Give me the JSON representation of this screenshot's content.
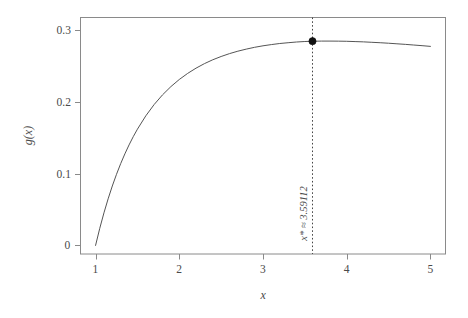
{
  "chart_data": {
    "type": "line",
    "title": "",
    "xlabel": "x",
    "ylabel": "g(x)",
    "xlim": [
      0.82,
      5.18
    ],
    "ylim": [
      -0.012,
      0.318
    ],
    "xticks": [
      "1",
      "2",
      "3",
      "4",
      "5"
    ],
    "xtick_values": [
      1,
      2,
      3,
      4,
      5
    ],
    "yticks": [
      "0",
      "0.1",
      "0.2",
      "0.3"
    ],
    "ytick_values": [
      0,
      0.1,
      0.2,
      0.3
    ],
    "grid": false,
    "legend": null,
    "frame": true,
    "series": [
      {
        "name": "g(x)",
        "x": [
          1.0,
          1.05,
          1.1,
          1.15,
          1.2,
          1.25,
          1.3,
          1.35,
          1.4,
          1.45,
          1.5,
          1.6,
          1.7,
          1.8,
          1.9,
          2.0,
          2.1,
          2.2,
          2.3,
          2.4,
          2.5,
          2.6,
          2.7,
          2.8,
          2.9,
          3.0,
          3.1,
          3.2,
          3.3,
          3.4,
          3.5,
          3.59112,
          3.7,
          3.8,
          3.9,
          4.0,
          4.1,
          4.2,
          4.3,
          4.4,
          4.5,
          4.6,
          4.7,
          4.8,
          4.9,
          5.0
        ],
        "y": [
          0.0,
          0.0238,
          0.0454,
          0.065,
          0.0829,
          0.0992,
          0.1141,
          0.1277,
          0.1402,
          0.1517,
          0.1622,
          0.1808,
          0.1966,
          0.2101,
          0.2216,
          0.2315,
          0.24,
          0.2473,
          0.2536,
          0.259,
          0.2636,
          0.2676,
          0.271,
          0.2739,
          0.2764,
          0.2785,
          0.2802,
          0.2817,
          0.2828,
          0.2838,
          0.2845,
          0.2849,
          0.2851,
          0.2851,
          0.285,
          0.2848,
          0.2844,
          0.284,
          0.2834,
          0.2828,
          0.2821,
          0.2813,
          0.2805,
          0.2796,
          0.2787,
          0.2777
        ]
      }
    ],
    "annotations": [
      {
        "name": "optimum-marker",
        "type": "point",
        "x": 3.59112,
        "y": 0.2849,
        "marker": "filled-circle"
      },
      {
        "name": "optimum-vline",
        "type": "vline",
        "x": 3.59112,
        "style": "dotted"
      },
      {
        "name": "optimum-label",
        "type": "text",
        "text": "x* ≈ 3.59112",
        "x": 3.59112,
        "rotation": 90
      }
    ],
    "colors": {
      "background": "#ffffff",
      "curve": "#555555",
      "frame": "#8a8a8a",
      "tick_text": "#4a4a4a",
      "marker": "#111111",
      "vline": "#444444"
    }
  },
  "axis": {
    "x_title": "x",
    "y_title": "g(x)"
  },
  "optimum": {
    "label": "x* ≈ 3.59112",
    "x_value": "3.59112",
    "y_value": "0.2849"
  }
}
